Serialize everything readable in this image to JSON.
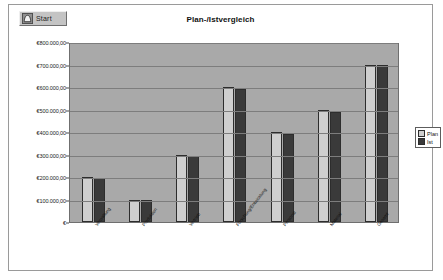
{
  "window": {
    "start_button_label": "Start",
    "start_button_icon": "document-icon"
  },
  "chart_data": {
    "type": "bar",
    "title": "Plan-/Istvergleich",
    "xlabel": "",
    "ylabel": "",
    "grid": true,
    "legend_position": "right",
    "ylim": [
      0,
      800000
    ],
    "ytick_labels": [
      "€800.000,00",
      "€700.000,00",
      "€600.000,00",
      "€500.000,00",
      "€400.000,00",
      "€300.000,00",
      "€200.000,00",
      "€100.000,00",
      "€"
    ],
    "ytick_values": [
      800000,
      700000,
      600000,
      500000,
      400000,
      300000,
      200000,
      100000,
      0
    ],
    "categories": [
      "Verwaltung",
      "Produktion",
      "Vertrieb",
      "Forschung/Entwicklung",
      "Personal",
      "Material",
      "Gesamt"
    ],
    "series": [
      {
        "name": "Plan",
        "color": "#cfcfcf",
        "values": [
          200000,
          100000,
          300000,
          600000,
          400000,
          500000,
          700000
        ]
      },
      {
        "name": "Ist",
        "color": "#3a3a3a",
        "values": [
          195000,
          98000,
          292000,
          590000,
          392000,
          488000,
          700000
        ]
      }
    ]
  }
}
